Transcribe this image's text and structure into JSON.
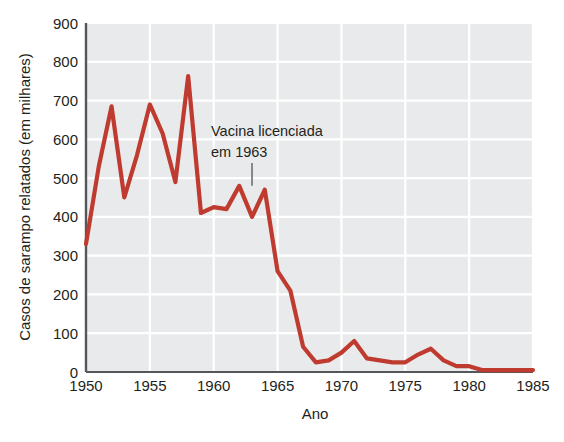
{
  "chart_data": {
    "type": "line",
    "title": "",
    "xlabel": "Ano",
    "ylabel": "Casos de sarampo relatados (em milhares)",
    "xlim": [
      1950,
      1985
    ],
    "ylim": [
      0,
      900
    ],
    "xticks": [
      1950,
      1955,
      1960,
      1965,
      1970,
      1975,
      1980,
      1985
    ],
    "xtick_labels": [
      "1950",
      "1955",
      "1960",
      "1965",
      "1970",
      "1975",
      "1980",
      "1985"
    ],
    "yticks": [
      0,
      100,
      200,
      300,
      400,
      500,
      600,
      700,
      800,
      900
    ],
    "ytick_labels": [
      "0",
      "100",
      "200",
      "300",
      "400",
      "500",
      "600",
      "700",
      "800",
      "900"
    ],
    "grid": true,
    "legend": false,
    "line_color": "#bf3b30",
    "plot_background": "#e9eaeb",
    "grid_color": "#ffffff",
    "x": [
      1950,
      1951,
      1952,
      1953,
      1954,
      1955,
      1956,
      1957,
      1958,
      1959,
      1960,
      1961,
      1962,
      1963,
      1964,
      1965,
      1966,
      1967,
      1968,
      1969,
      1970,
      1971,
      1972,
      1973,
      1974,
      1975,
      1976,
      1977,
      1978,
      1979,
      1980,
      1981,
      1982,
      1983,
      1984,
      1985
    ],
    "values": [
      330,
      530,
      685,
      450,
      560,
      690,
      615,
      490,
      763,
      410,
      425,
      420,
      480,
      400,
      470,
      260,
      210,
      65,
      25,
      30,
      50,
      80,
      35,
      30,
      25,
      25,
      45,
      60,
      30,
      15,
      15,
      5,
      5,
      5,
      5,
      5
    ],
    "series": [
      {
        "name": "Casos de sarampo relatados (em milhares)",
        "color": "#bf3b30",
        "values": [
          330,
          530,
          685,
          450,
          560,
          690,
          615,
          490,
          763,
          410,
          425,
          420,
          480,
          400,
          470,
          260,
          210,
          65,
          25,
          30,
          50,
          80,
          35,
          30,
          25,
          25,
          45,
          60,
          30,
          15,
          15,
          5,
          5,
          5,
          5,
          5
        ]
      }
    ],
    "annotations": [
      {
        "name": "vaccine-licensed-annotation",
        "line1": "Vacina licenciada",
        "line2": "em 1963",
        "points_to_year": 1963,
        "points_to_value": 480
      }
    ]
  }
}
